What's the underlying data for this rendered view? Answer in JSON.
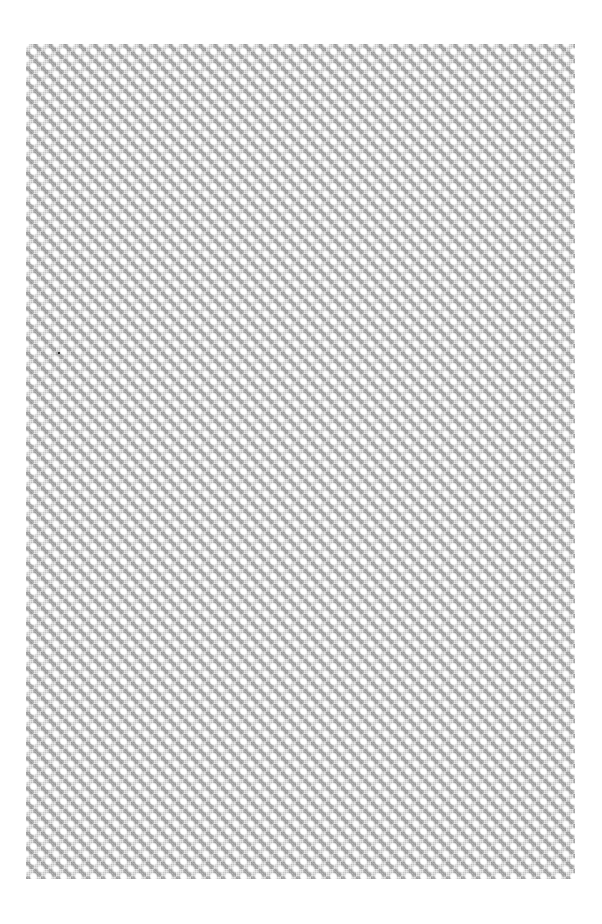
{
  "canvas": {
    "width": 602,
    "height": 924,
    "background": "#ffffff"
  },
  "pattern": {
    "type": "diamond-dot-lattice",
    "region": {
      "x": 26,
      "y": 44,
      "width": 549,
      "height": 835
    },
    "tile_px": 15,
    "colors": {
      "base_gray": "#c4c4c4",
      "dark_diamond": "#787878",
      "dot": "#ffffff"
    }
  },
  "speck": {
    "x": 58,
    "y": 352,
    "color": "#333333"
  }
}
